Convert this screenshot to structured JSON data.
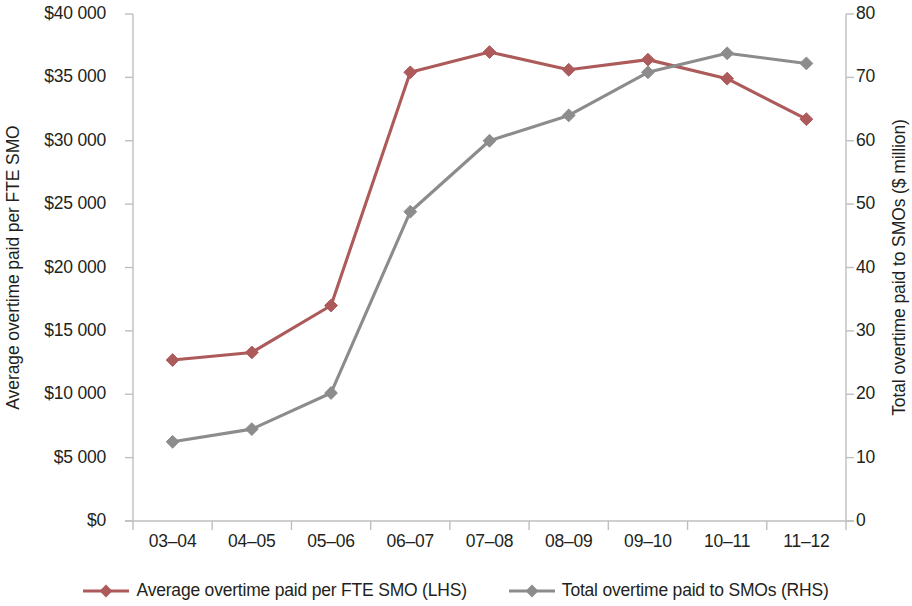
{
  "chart_data": {
    "type": "line",
    "title": "",
    "subtitle": "",
    "xlabel": "",
    "categories": [
      "03–04",
      "04–05",
      "05–06",
      "06–07",
      "07–08",
      "08–09",
      "09–10",
      "10–11",
      "11–12"
    ],
    "grid": false,
    "legend_position": "bottom",
    "axes": {
      "left": {
        "label": "Average overtime paid per FTE SMO",
        "ticks": [
          "$0",
          "$5 000",
          "$10 000",
          "$15 000",
          "$20 000",
          "$25 000",
          "$30 000",
          "$35 000",
          "$40 000"
        ],
        "tick_values": [
          0,
          5000,
          10000,
          15000,
          20000,
          25000,
          30000,
          35000,
          40000
        ],
        "ylim": [
          0,
          40000
        ]
      },
      "right": {
        "label": "Total overtime paid to SMOs ($ million)",
        "ticks": [
          "0",
          "10",
          "20",
          "30",
          "40",
          "50",
          "60",
          "70",
          "80"
        ],
        "tick_values": [
          0,
          10,
          20,
          30,
          40,
          50,
          60,
          70,
          80
        ],
        "ylim": [
          0,
          80
        ]
      }
    },
    "series": [
      {
        "name": "Average overtime paid per FTE SMO (LHS)",
        "axis": "left",
        "color": "#ad5a5a",
        "marker": "diamond",
        "values": [
          12700,
          13300,
          17000,
          35400,
          37000,
          35600,
          36400,
          34900,
          31700
        ]
      },
      {
        "name": "Total overtime paid to SMOs (RHS)",
        "axis": "right",
        "color": "#8c8c8c",
        "marker": "diamond",
        "values": [
          12.5,
          14.5,
          20.2,
          48.8,
          60.0,
          64.0,
          70.8,
          73.8,
          72.2
        ]
      }
    ]
  },
  "legend": {
    "items": [
      {
        "label": "Average overtime paid per FTE SMO (LHS)",
        "color": "#ad5a5a"
      },
      {
        "label": "Total overtime paid to SMOs (RHS)",
        "color": "#8c8c8c"
      }
    ]
  },
  "colors": {
    "series_red": "#ad5a5a",
    "series_grey": "#8c8c8c",
    "axis": "#bfbfbf",
    "text": "#231f20",
    "background": "#ffffff"
  }
}
